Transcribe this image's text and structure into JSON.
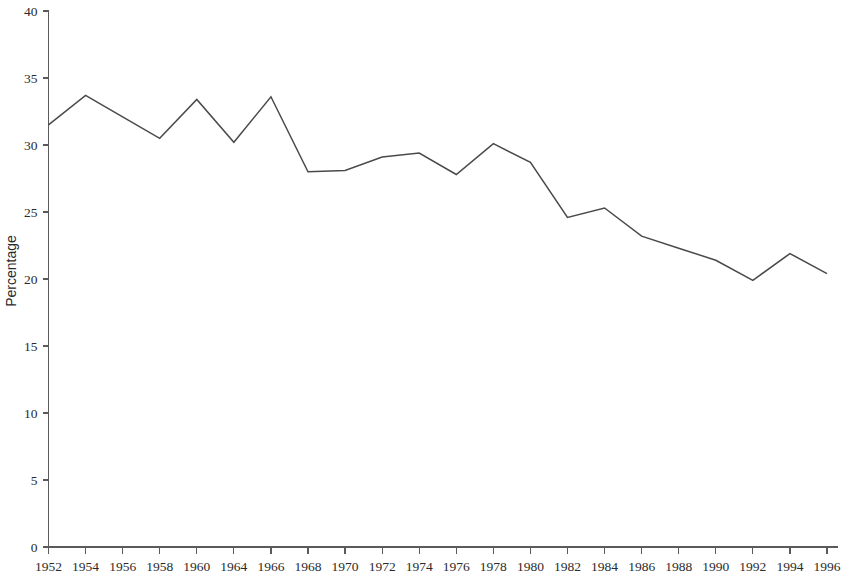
{
  "chart_data": {
    "type": "line",
    "title": "",
    "subtitle": "",
    "xlabel": "",
    "ylabel": "Percentage",
    "grid": false,
    "legend": false,
    "legend_position": "none",
    "line_color": "#4a4a4a",
    "axis_color": "#5a5a5a",
    "background_color": "#ffffff",
    "xlim": [
      1952,
      1996
    ],
    "ylim": [
      0,
      40
    ],
    "y_ticks": [
      0,
      5,
      10,
      15,
      20,
      25,
      30,
      35,
      40
    ],
    "y_tick_labels": [
      "0",
      "5",
      "10",
      "15",
      "20",
      "25",
      "30",
      "35",
      "40"
    ],
    "x_tick_labels": [
      "1952",
      "1954",
      "1956",
      "1958",
      "1960",
      "1964",
      "1966",
      "1968",
      "1970",
      "1972",
      "1974",
      "1976",
      "1978",
      "1980",
      "1982",
      "1984",
      "1986",
      "1988",
      "1990",
      "1992",
      "1994",
      "1996"
    ],
    "categories": [
      "1952",
      "1954",
      "1956",
      "1958",
      "1960",
      "1964",
      "1966",
      "1968",
      "1970",
      "1972",
      "1974",
      "1976",
      "1978",
      "1980",
      "1982",
      "1984",
      "1986",
      "1988",
      "1990",
      "1992",
      "1994",
      "1996"
    ],
    "values": [
      31.5,
      33.7,
      32.1,
      30.5,
      33.4,
      30.2,
      33.6,
      28.0,
      28.1,
      29.1,
      29.4,
      27.8,
      30.1,
      28.7,
      24.6,
      25.3,
      23.2,
      22.3,
      21.4,
      19.9,
      21.9,
      20.4
    ],
    "series": [
      {
        "name": "Percentage",
        "values": [
          31.5,
          33.7,
          32.1,
          30.5,
          33.4,
          30.2,
          33.6,
          28.0,
          28.1,
          29.1,
          29.4,
          27.8,
          30.1,
          28.7,
          24.6,
          25.3,
          23.2,
          22.3,
          21.4,
          19.9,
          21.9,
          20.4
        ]
      }
    ]
  }
}
